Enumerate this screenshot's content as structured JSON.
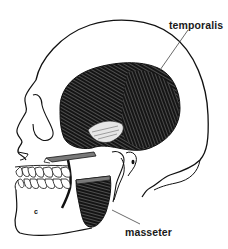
{
  "diagram": {
    "labels": [
      {
        "id": "temporalis",
        "text": "temporalis"
      },
      {
        "id": "masseter",
        "text": "masseter"
      }
    ],
    "mandible_mark": "c",
    "colors": {
      "line": "#111111",
      "muscle": "#141414",
      "background": "#ffffff",
      "leader": "#444444"
    }
  }
}
